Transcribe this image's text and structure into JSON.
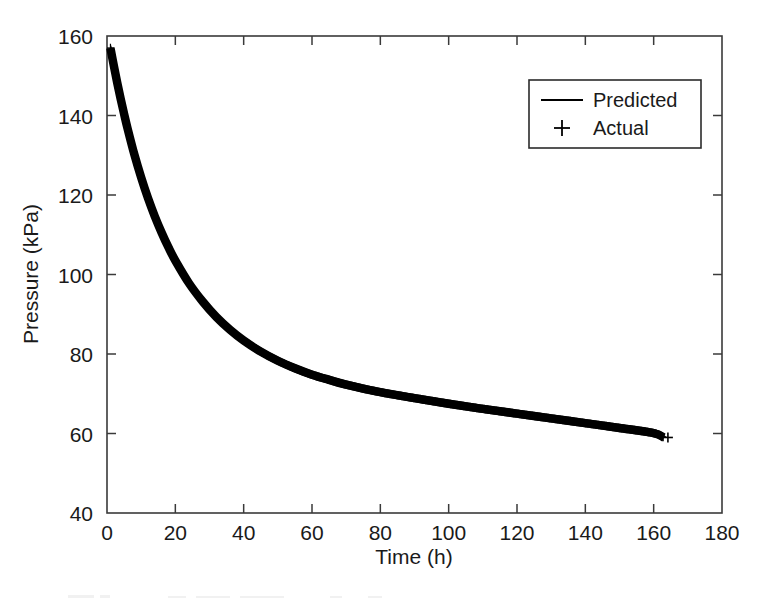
{
  "figure": {
    "background_color": "#ffffff",
    "ink_color": "#000000",
    "axis_color": "#3a3a3a"
  },
  "chart_data": {
    "type": "line",
    "title": "",
    "xlabel": "Time (h)",
    "ylabel": "Pressure (kPa)",
    "xlim": [
      0,
      180
    ],
    "ylim": [
      40,
      160
    ],
    "xticks": [
      0,
      20,
      40,
      60,
      80,
      100,
      120,
      140,
      160,
      180
    ],
    "yticks": [
      40,
      60,
      80,
      100,
      120,
      140,
      160
    ],
    "xtick_labels": [
      "0",
      "20",
      "40",
      "60",
      "80",
      "100",
      "120",
      "140",
      "160",
      "180"
    ],
    "ytick_labels": [
      "40",
      "60",
      "80",
      "100",
      "120",
      "140",
      "160"
    ],
    "grid": false,
    "box": true,
    "tick_direction": "in",
    "legend": {
      "position": "upper-right",
      "entries": [
        {
          "label": "Predicted",
          "marker": "line",
          "color": "#000000"
        },
        {
          "label": "Actual",
          "marker": "plus",
          "color": "#000000"
        }
      ]
    },
    "series": [
      {
        "name": "Predicted",
        "style": "line",
        "x": [
          1,
          2,
          3,
          4,
          5,
          6,
          8,
          10,
          12,
          14,
          16,
          18,
          20,
          24,
          28,
          32,
          36,
          40,
          45,
          50,
          55,
          60,
          65,
          70,
          80,
          90,
          100,
          110,
          120,
          130,
          140,
          150,
          160,
          163
        ],
        "y": [
          157.0,
          152.5,
          148.2,
          144.2,
          140.4,
          136.8,
          130.2,
          124.4,
          119.2,
          114.6,
          110.5,
          106.8,
          103.5,
          97.8,
          93.2,
          89.3,
          86.1,
          83.4,
          80.6,
          78.3,
          76.4,
          74.8,
          73.5,
          72.3,
          70.4,
          68.9,
          67.5,
          66.2,
          65.0,
          63.8,
          62.6,
          61.4,
          60.1,
          59.0
        ]
      },
      {
        "name": "Actual",
        "style": "plus-markers",
        "note": "Dense + markers overlay the predicted curve along its entire length",
        "x": [
          1,
          2,
          3,
          4,
          5,
          6,
          8,
          10,
          12,
          14,
          16,
          18,
          20,
          24,
          28,
          32,
          36,
          40,
          45,
          50,
          55,
          60,
          65,
          70,
          80,
          90,
          100,
          110,
          120,
          130,
          140,
          150,
          160,
          163
        ],
        "y": [
          157.0,
          152.5,
          148.2,
          144.2,
          140.4,
          136.8,
          130.2,
          124.4,
          119.2,
          114.6,
          110.5,
          106.8,
          103.5,
          97.8,
          93.2,
          89.3,
          86.1,
          83.4,
          80.6,
          78.3,
          76.4,
          74.8,
          73.5,
          72.3,
          70.4,
          68.9,
          67.5,
          66.2,
          65.0,
          63.8,
          62.6,
          61.4,
          60.1,
          59.0
        ]
      }
    ]
  }
}
